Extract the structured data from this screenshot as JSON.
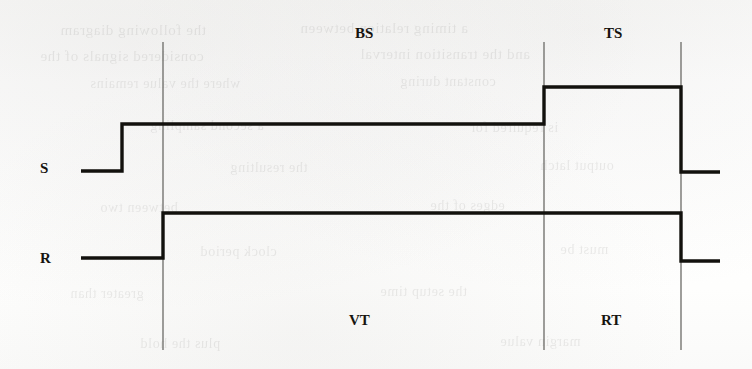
{
  "figure": {
    "type": "timing-diagram",
    "background_color": "#fdfdfc",
    "line_color": "#12110d",
    "divider_color": "#6b6a66",
    "canvas": {
      "width": 752,
      "height": 369
    }
  },
  "signal_labels": [
    {
      "name": "s-label",
      "text": "S",
      "x": 40,
      "y": 161
    },
    {
      "name": "r-label",
      "text": "R",
      "x": 40,
      "y": 251
    }
  ],
  "phase_labels": [
    {
      "name": "bs-label",
      "text": "BS",
      "x": 355,
      "y": 26
    },
    {
      "name": "ts-label",
      "text": "TS",
      "x": 604,
      "y": 26
    },
    {
      "name": "vt-label",
      "text": "VT",
      "x": 349,
      "y": 313
    },
    {
      "name": "rt-label",
      "text": "RT",
      "x": 601,
      "y": 313
    }
  ],
  "dividers": [
    {
      "name": "divider-1",
      "x": 163,
      "y_top": 42,
      "y_bottom": 350
    },
    {
      "name": "divider-2",
      "x": 544,
      "y_top": 42,
      "y_bottom": 350
    },
    {
      "name": "divider-3",
      "x": 681,
      "y_top": 42,
      "y_bottom": 350
    }
  ],
  "waveforms": [
    {
      "name": "signal-s-waveform",
      "label": "S",
      "levels": {
        "low": 171,
        "high": 124,
        "higher": 87
      },
      "points": "81,171 122,171 122,124 544,124 544,87 681,87 681,172 720,172"
    },
    {
      "name": "signal-r-waveform",
      "label": "R",
      "levels": {
        "low": 258,
        "high": 213,
        "low_end": 261
      },
      "points": "81,258 163,258 163,213 681,213 681,261 720,261"
    }
  ],
  "ghost_text": {
    "note": "faint mirrored bleed-through from the reverse side of the scanned page",
    "lines": [
      {
        "text": "the following diagram",
        "x": 60,
        "y": 22,
        "size": 15
      },
      {
        "text": "a timing relation between",
        "x": 300,
        "y": 20,
        "size": 15
      },
      {
        "text": "considered signals of the",
        "x": 40,
        "y": 48,
        "size": 15
      },
      {
        "text": "and the transition interval",
        "x": 360,
        "y": 46,
        "size": 15
      },
      {
        "text": "where the value remains",
        "x": 90,
        "y": 76,
        "size": 14
      },
      {
        "text": "constant during",
        "x": 400,
        "y": 74,
        "size": 14
      },
      {
        "text": "a second sampling",
        "x": 150,
        "y": 118,
        "size": 14
      },
      {
        "text": "is required for",
        "x": 470,
        "y": 120,
        "size": 14
      },
      {
        "text": "the resulting",
        "x": 230,
        "y": 160,
        "size": 14
      },
      {
        "text": "output latch",
        "x": 540,
        "y": 158,
        "size": 14
      },
      {
        "text": "between two",
        "x": 100,
        "y": 200,
        "size": 14
      },
      {
        "text": "edges of the",
        "x": 430,
        "y": 198,
        "size": 14
      },
      {
        "text": "clock period",
        "x": 200,
        "y": 244,
        "size": 14
      },
      {
        "text": "must be",
        "x": 560,
        "y": 242,
        "size": 14
      },
      {
        "text": "greater than",
        "x": 70,
        "y": 286,
        "size": 14
      },
      {
        "text": "the setup time",
        "x": 380,
        "y": 284,
        "size": 14
      },
      {
        "text": "plus the hold",
        "x": 140,
        "y": 336,
        "size": 14
      },
      {
        "text": "margin value",
        "x": 500,
        "y": 334,
        "size": 14
      }
    ]
  }
}
